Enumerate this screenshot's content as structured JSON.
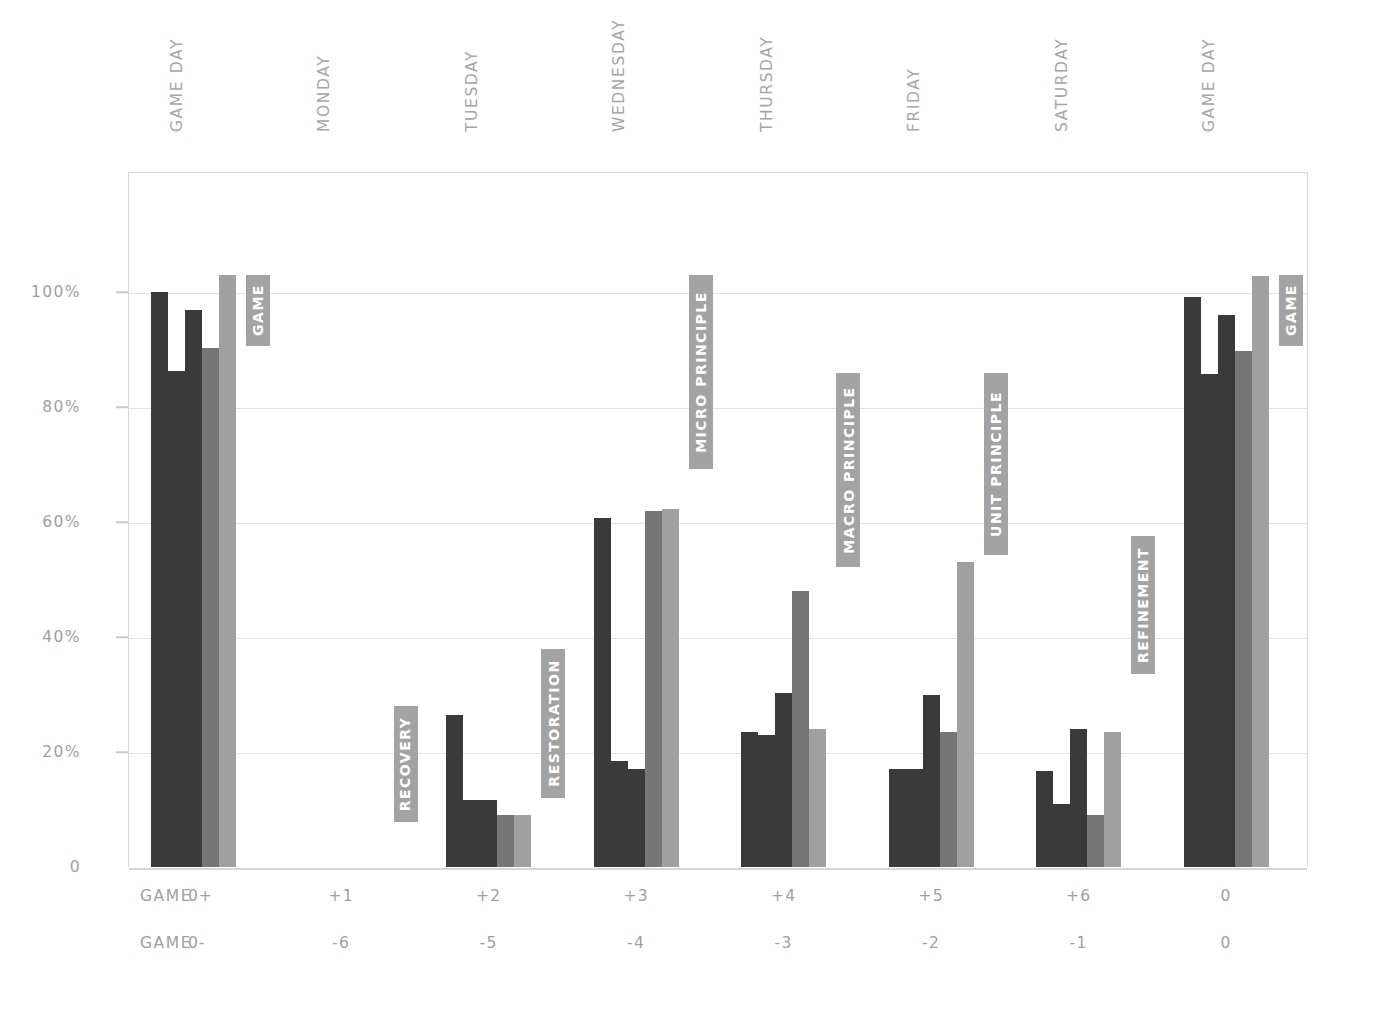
{
  "chart_data": {
    "type": "bar",
    "title": "",
    "subtitle": "",
    "xlabel": "",
    "ylabel": "",
    "ylim": [
      0,
      120
    ],
    "grid": true,
    "legend_position": "none",
    "y_ticks": [
      {
        "value": 0,
        "label": "0"
      },
      {
        "value": 20,
        "label": "20%"
      },
      {
        "value": 40,
        "label": "40%"
      },
      {
        "value": 60,
        "label": "60%"
      },
      {
        "value": 80,
        "label": "80%"
      },
      {
        "value": 100,
        "label": "100%"
      }
    ],
    "categories": [
      "GAME DAY",
      "MONDAY",
      "TUESDAY",
      "WEDNESDAY",
      "THURSDAY",
      "FRIDAY",
      "SATURDAY",
      "GAME DAY"
    ],
    "series": [
      {
        "name": "series-1",
        "color": "#3a3a3a",
        "values": [
          100.0,
          0,
          26.5,
          60.7,
          23.5,
          17.0,
          16.7,
          99.2
        ]
      },
      {
        "name": "series-2",
        "color": "#3a3a3a",
        "values": [
          86.3,
          0,
          11.7,
          18.5,
          23.0,
          17.0,
          11.0,
          85.8
        ]
      },
      {
        "name": "series-3",
        "color": "#3a3a3a",
        "values": [
          96.8,
          0,
          11.7,
          17.0,
          30.3,
          30.0,
          24.0,
          96.0
        ]
      },
      {
        "name": "series-4",
        "color": "#767676",
        "values": [
          90.3,
          0,
          9.0,
          62.0,
          48.0,
          23.4,
          9.0,
          89.7
        ]
      },
      {
        "name": "series-5",
        "color": "#a0a0a0",
        "values": [
          103.0,
          0,
          9.0,
          62.3,
          24.0,
          53.0,
          23.4,
          102.8
        ]
      }
    ],
    "bottom_rows": [
      {
        "title": "GAME +",
        "values": [
          "0",
          "+1",
          "+2",
          "+3",
          "+4",
          "+5",
          "+6",
          "0"
        ]
      },
      {
        "title": "GAME -",
        "values": [
          "0",
          "-6",
          "-5",
          "-4",
          "-3",
          "-2",
          "-1",
          "0"
        ]
      }
    ],
    "annotations": [
      {
        "label": "GAME",
        "group": 0,
        "top_pct": 103.0
      },
      {
        "label": "RECOVERY",
        "group": 1,
        "top_pct": 28.0
      },
      {
        "label": "RESTORATION",
        "group": 2,
        "top_pct": 38.0
      },
      {
        "label": "MICRO PRINCIPLE",
        "group": 3,
        "top_pct": 103.0
      },
      {
        "label": "MACRO PRINCIPLE",
        "group": 4,
        "top_pct": 86.0
      },
      {
        "label": "UNIT PRINCIPLE",
        "group": 5,
        "top_pct": 86.0
      },
      {
        "label": "REFINEMENT",
        "group": 6,
        "top_pct": 57.5
      },
      {
        "label": "GAME",
        "group": 7,
        "top_pct": 103.0
      }
    ],
    "colors": {
      "bar_dark": "#3a3a3a",
      "bar_mid": "#767676",
      "bar_light": "#a0a0a0",
      "tag_bg": "#a3a3a3",
      "tag_text": "#ffffff",
      "grid": "#e4e4e4",
      "axis": "#d6d6d6",
      "text": "#a0a0a0",
      "background": "#ffffff"
    }
  }
}
